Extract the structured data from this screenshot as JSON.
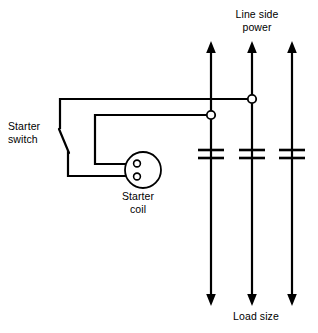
{
  "diagram": {
    "background_color": "#ffffff",
    "stroke_color": "#000000",
    "labels": {
      "line_side_power": "Line side\npower",
      "load_size": "Load size",
      "starter_switch": "Starter\nswitch",
      "starter_coil": "Starter\ncoil"
    },
    "components": {
      "vertical_lines": [
        {
          "name": "line-1",
          "x": 211,
          "top_y": 44,
          "bottom_y": 303
        },
        {
          "name": "line-2",
          "x": 252,
          "top_y": 44,
          "bottom_y": 303
        },
        {
          "name": "line-3",
          "x": 292,
          "top_y": 44,
          "bottom_y": 303
        }
      ],
      "fuse_symbols": [
        {
          "name": "fuse-1",
          "x": 211,
          "y": 152
        },
        {
          "name": "fuse-2",
          "x": 252,
          "y": 152
        },
        {
          "name": "fuse-3",
          "x": 292,
          "y": 152
        }
      ],
      "terminals": [
        {
          "name": "terminal-line-2-upper",
          "x": 252,
          "y": 99
        },
        {
          "name": "terminal-line-1-lower",
          "x": 211,
          "y": 115
        }
      ],
      "starter_coil": {
        "center_x": 143,
        "center_y": 170,
        "radius": 18,
        "terminals": [
          {
            "name": "coil-terminal-top",
            "x": 137,
            "y": 163
          },
          {
            "name": "coil-terminal-bottom",
            "x": 137,
            "y": 177
          }
        ]
      },
      "starter_switch": {
        "pivot_x": 60,
        "pivot_y": 128,
        "blade_end_x": 68,
        "blade_end_y": 152
      }
    }
  }
}
